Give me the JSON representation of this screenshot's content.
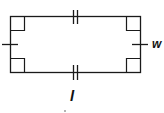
{
  "diagram": {
    "shape": "rectangle",
    "stroke_color": "#1a1a1a",
    "labels": {
      "width": "w",
      "length": "l"
    },
    "marks": {
      "right_angles": 4,
      "length_ticks": 2,
      "width_ticks": 1
    },
    "footnote_mark": "."
  }
}
